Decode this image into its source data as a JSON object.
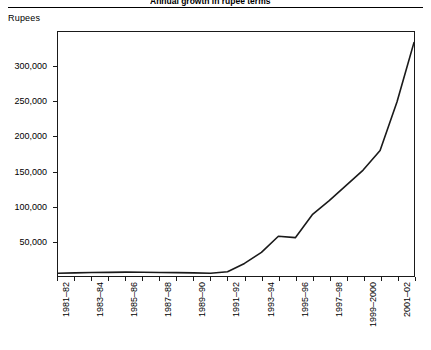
{
  "figure": {
    "unit_label": "Rupees",
    "title_partial": "Annual growth in rupee terms"
  },
  "chart_data": {
    "type": "line",
    "title": "",
    "xlabel": "",
    "ylabel": "Rupees",
    "ylim": [
      0,
      350000
    ],
    "y_ticks": [
      50000,
      100000,
      150000,
      200000,
      250000,
      300000
    ],
    "y_tick_labels": [
      "50,000",
      "100,000",
      "150,000",
      "200,000",
      "250,000",
      "300,000"
    ],
    "grid": false,
    "legend": "none",
    "line_color": "#1a1a1a",
    "categories": [
      "1981–82",
      "1982–83",
      "1983–84",
      "1984–85",
      "1985–86",
      "1986–87",
      "1987–88",
      "1988–89",
      "1989–90",
      "1990–91",
      "1991–92",
      "1992–93",
      "1993–94",
      "1994–95",
      "1995–96",
      "1996–97",
      "1997–98",
      "1998–99",
      "1999–2000",
      "2000–01",
      "2001–02",
      "2002–03"
    ],
    "x_tick_labels": [
      "1981–82",
      "1983–84",
      "1985–86",
      "1987–88",
      "1989–90",
      "1991–92",
      "1993–94",
      "1995–96",
      "1997–98",
      "1999–2000",
      "2001–02"
    ],
    "values": [
      4000,
      4500,
      5000,
      5200,
      5500,
      5300,
      5000,
      4800,
      4500,
      4000,
      6000,
      18000,
      34000,
      57000,
      55000,
      88000,
      108000,
      130000,
      152000,
      180000,
      250000,
      335000
    ]
  }
}
